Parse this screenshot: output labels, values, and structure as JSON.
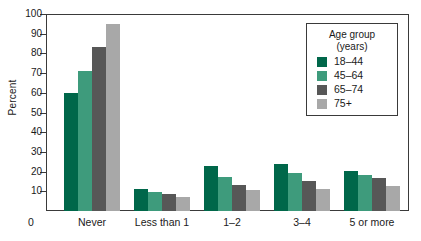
{
  "chart_data": {
    "type": "bar",
    "title": "",
    "xlabel": "",
    "ylabel": "Percent",
    "ylim": [
      0,
      100
    ],
    "ytick_step": 10,
    "yticks": [
      0,
      10,
      20,
      30,
      40,
      50,
      60,
      70,
      80,
      90,
      100
    ],
    "grid": false,
    "legend_position": "top-right",
    "legend_title": "Age group",
    "legend_subtitle": "(years)",
    "categories": [
      "Never",
      "Less than 1",
      "1–2",
      "3–4",
      "5 or more"
    ],
    "series": [
      {
        "name": "18–44",
        "color": "#00674a",
        "values": [
          60.0,
          11.0,
          23.0,
          24.0,
          20.5
        ]
      },
      {
        "name": "45–64",
        "color": "#3e9b7c",
        "values": [
          71.0,
          9.8,
          17.5,
          19.5,
          18.5
        ]
      },
      {
        "name": "65–74",
        "color": "#575757",
        "values": [
          83.5,
          8.5,
          13.0,
          15.0,
          17.0
        ]
      },
      {
        "name": "75+",
        "color": "#a8a8a8",
        "values": [
          95.0,
          7.3,
          10.5,
          11.0,
          12.5
        ]
      }
    ]
  }
}
